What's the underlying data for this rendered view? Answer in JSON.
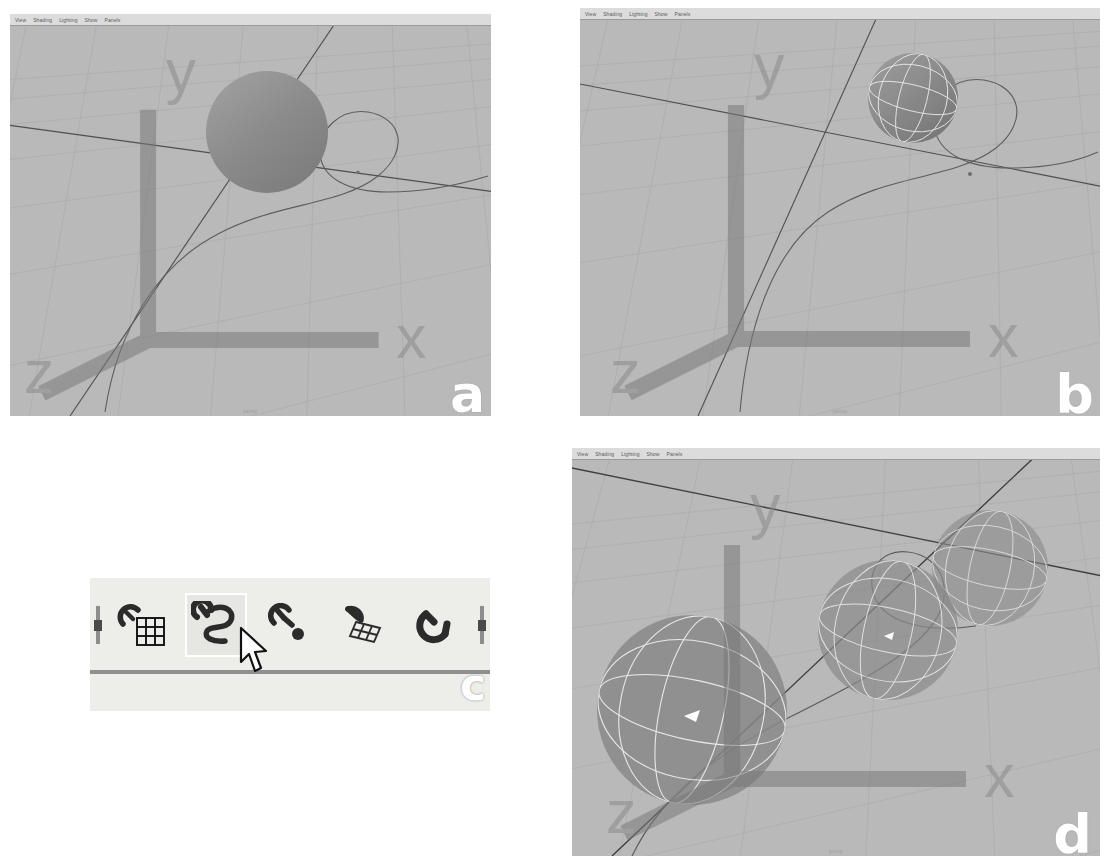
{
  "figure": {
    "kind": "multi-panel-screenshot-figure",
    "panel_labels": [
      "a",
      "b",
      "c",
      "d"
    ],
    "background_color": "#ffffff"
  },
  "viewport_menu": {
    "items": [
      "View",
      "Shading",
      "Lighting",
      "Show",
      "Panels"
    ]
  },
  "colors": {
    "viewport_background": "#b9b9b9",
    "menubar_background": "#dcdcdc",
    "grid_line": "#a6a6a6",
    "axis_line": "#4a4a4a",
    "curve_line": "#5c5c5c",
    "sphere_fill": "#8e8e8e",
    "wireframe": "#f0f0f0",
    "toolbar_background": "#ededea",
    "toolbar_separator": "#8f8f8f",
    "selection_highlight": "#ffffff",
    "panel_label": "#ffffff"
  },
  "panels": {
    "a": {
      "label": "a",
      "camera_label": "persp",
      "menu": [
        "View",
        "Shading",
        "Lighting",
        "Show",
        "Panels"
      ],
      "axis_gizmo": {
        "labels": [
          "y",
          "x",
          "z"
        ]
      },
      "scene": {
        "description": "Flat-shaded NURBS sphere positioned above the grid, with an S-shaped NURBS curve running through the scene",
        "spheres": 1,
        "sphere_shading": "flat-shaded, no wireframe",
        "curves": 1,
        "curve_shape": "S-curve"
      }
    },
    "b": {
      "label": "b",
      "camera_label": "persp",
      "menu": [
        "View",
        "Shading",
        "Lighting",
        "Show",
        "Panels"
      ],
      "axis_gizmo": {
        "labels": [
          "y",
          "x",
          "z"
        ]
      },
      "scene": {
        "description": "Smaller sphere snapped onto the curve, displayed with white isoparm wireframe over shading",
        "spheres": 1,
        "sphere_shading": "shaded with wireframe isoparms",
        "curves": 1,
        "curve_shape": "S-curve"
      }
    },
    "c": {
      "label": "c",
      "description": "Maya snap-mode toolbar detail with the snap-to-curve button active and the mouse pointer over it",
      "selected_index": 1,
      "cursor": "arrow-pointer",
      "buttons": [
        {
          "icon": "snap-to-grid-icon",
          "name": "Snap to grids",
          "selected": false
        },
        {
          "icon": "snap-to-curve-icon",
          "name": "Snap to curves",
          "selected": true
        },
        {
          "icon": "snap-to-point-icon",
          "name": "Snap to points",
          "selected": false
        },
        {
          "icon": "snap-to-view-plane-icon",
          "name": "Snap to view planes",
          "selected": false
        },
        {
          "icon": "snap-to-live-object-icon",
          "name": "Make the selected object live",
          "selected": false
        }
      ]
    },
    "d": {
      "label": "d",
      "camera_label": "persp",
      "menu": [
        "View",
        "Shading",
        "Lighting",
        "Show",
        "Panels"
      ],
      "axis_gizmo": {
        "labels": [
          "y",
          "x",
          "z"
        ]
      },
      "scene": {
        "description": "Three semi-transparent spheres with white isoparm wireframes distributed along the curve, decreasing in apparent size with distance",
        "spheres": 3,
        "sphere_shading": "semi-transparent with wireframe isoparms",
        "curves": 1,
        "curve_shape": "S-curve"
      }
    }
  }
}
